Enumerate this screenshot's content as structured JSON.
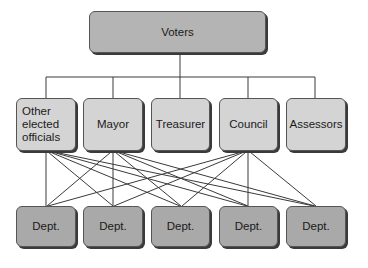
{
  "diagram": {
    "top": {
      "label": "Voters"
    },
    "officials": [
      {
        "label": "Other elected officials"
      },
      {
        "label": "Mayor"
      },
      {
        "label": "Treasurer"
      },
      {
        "label": "Council"
      },
      {
        "label": "Assessors"
      }
    ],
    "departments": [
      {
        "label": "Dept."
      },
      {
        "label": "Dept."
      },
      {
        "label": "Dept."
      },
      {
        "label": "Dept."
      },
      {
        "label": "Dept."
      }
    ],
    "connections": {
      "voters_to_officials": [
        "Other elected officials",
        "Mayor",
        "Treasurer",
        "Council",
        "Assessors"
      ],
      "officials_to_departments": {
        "Other elected officials": [
          1,
          2,
          3,
          4,
          5
        ],
        "Mayor": [
          1,
          2,
          3,
          4,
          5
        ],
        "Council": [
          1,
          2,
          3,
          4,
          5
        ]
      }
    },
    "colors": {
      "top_fill": "#b4b4b4",
      "officials_fill": "#d4d4d4",
      "department_fill": "#a9a9a9",
      "line": "#333333"
    }
  }
}
